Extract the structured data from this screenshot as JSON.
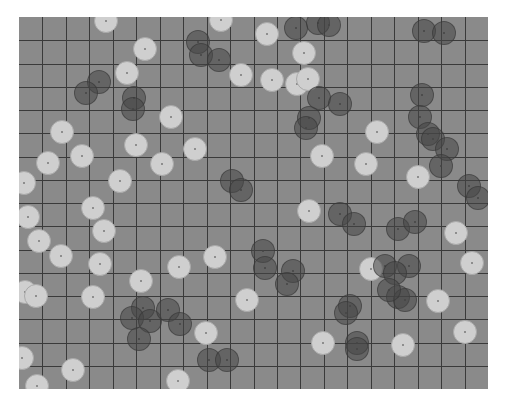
{
  "board": {
    "background": "#8a8a8a",
    "grid_color": "#3a3a3a",
    "cols": 20,
    "rows": 16,
    "cell_size": 23.45
  },
  "pieces": {
    "light": [
      [
        106,
        21
      ],
      [
        221,
        20
      ],
      [
        145,
        49
      ],
      [
        267,
        34
      ],
      [
        304,
        53
      ],
      [
        127,
        73
      ],
      [
        241,
        75
      ],
      [
        272,
        80
      ],
      [
        297,
        84
      ],
      [
        308,
        79
      ],
      [
        171,
        117
      ],
      [
        377,
        132
      ],
      [
        62,
        132
      ],
      [
        136,
        145
      ],
      [
        195,
        149
      ],
      [
        82,
        156
      ],
      [
        48,
        163
      ],
      [
        162,
        164
      ],
      [
        322,
        156
      ],
      [
        366,
        164
      ],
      [
        24,
        183
      ],
      [
        120,
        181
      ],
      [
        418,
        177
      ],
      [
        309,
        211
      ],
      [
        93,
        208
      ],
      [
        28,
        217
      ],
      [
        104,
        231
      ],
      [
        39,
        241
      ],
      [
        456,
        233
      ],
      [
        61,
        256
      ],
      [
        215,
        257
      ],
      [
        179,
        267
      ],
      [
        100,
        264
      ],
      [
        371,
        269
      ],
      [
        472,
        263
      ],
      [
        141,
        281
      ],
      [
        25,
        292
      ],
      [
        36,
        296
      ],
      [
        93,
        297
      ],
      [
        247,
        300
      ],
      [
        438,
        301
      ],
      [
        206,
        333
      ],
      [
        465,
        332
      ],
      [
        323,
        343
      ],
      [
        403,
        345
      ],
      [
        22,
        358
      ],
      [
        73,
        370
      ],
      [
        178,
        381
      ],
      [
        37,
        386
      ]
    ],
    "dark": [
      [
        296,
        28
      ],
      [
        318,
        23
      ],
      [
        329,
        25
      ],
      [
        424,
        31
      ],
      [
        444,
        33
      ],
      [
        198,
        42
      ],
      [
        201,
        55
      ],
      [
        219,
        60
      ],
      [
        99,
        82
      ],
      [
        86,
        93
      ],
      [
        134,
        98
      ],
      [
        133,
        109
      ],
      [
        319,
        98
      ],
      [
        340,
        104
      ],
      [
        309,
        118
      ],
      [
        306,
        128
      ],
      [
        422,
        95
      ],
      [
        420,
        117
      ],
      [
        428,
        134
      ],
      [
        433,
        139
      ],
      [
        447,
        149
      ],
      [
        441,
        166
      ],
      [
        232,
        181
      ],
      [
        241,
        190
      ],
      [
        469,
        186
      ],
      [
        478,
        198
      ],
      [
        340,
        214
      ],
      [
        354,
        224
      ],
      [
        398,
        229
      ],
      [
        415,
        222
      ],
      [
        263,
        251
      ],
      [
        265,
        268
      ],
      [
        293,
        271
      ],
      [
        287,
        284
      ],
      [
        385,
        266
      ],
      [
        409,
        266
      ],
      [
        395,
        273
      ],
      [
        398,
        297
      ],
      [
        405,
        300
      ],
      [
        389,
        290
      ],
      [
        350,
        306
      ],
      [
        346,
        313
      ],
      [
        143,
        308
      ],
      [
        132,
        318
      ],
      [
        150,
        321
      ],
      [
        168,
        310
      ],
      [
        180,
        324
      ],
      [
        139,
        339
      ],
      [
        209,
        360
      ],
      [
        227,
        360
      ],
      [
        357,
        343
      ],
      [
        357,
        349
      ]
    ]
  }
}
